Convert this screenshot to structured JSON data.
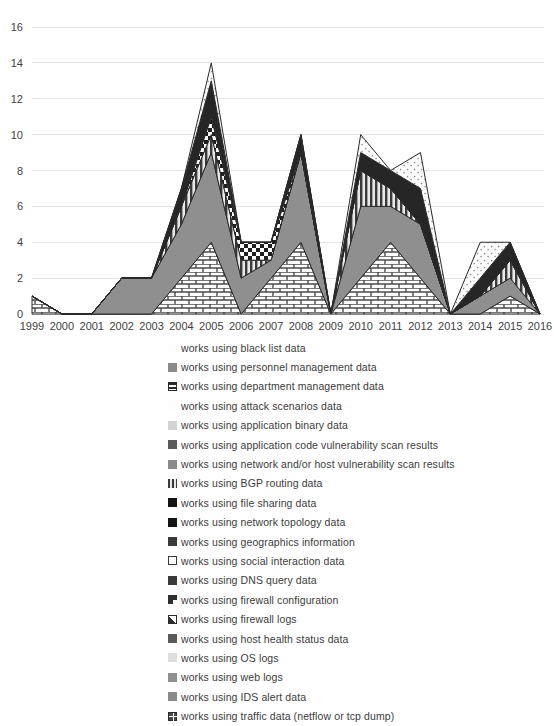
{
  "chart_data": {
    "type": "area",
    "stacked": true,
    "title": "",
    "xlabel": "",
    "ylabel": "",
    "ylim": [
      0,
      16
    ],
    "ytick_step": 2,
    "yticks": [
      "0",
      "2",
      "4",
      "6",
      "8",
      "10",
      "12",
      "14",
      "16"
    ],
    "grid": true,
    "legend_position": "bottom",
    "categories": [
      "1999",
      "2000",
      "2001",
      "2002",
      "2003",
      "2004",
      "2005",
      "2006",
      "2007",
      "2008",
      "2009",
      "2010",
      "2011",
      "2012",
      "2013",
      "2014",
      "2015",
      "2016"
    ],
    "totals": [
      1,
      0,
      0,
      2,
      2,
      7,
      14,
      4,
      4,
      10,
      0,
      10,
      8,
      9,
      0,
      4,
      4,
      0
    ],
    "series": [
      {
        "name": "works using black list data",
        "marker": "dotted-light",
        "color": "#f2f2f2",
        "values": [
          0,
          0,
          0,
          0,
          0,
          0,
          0,
          0,
          0,
          0,
          0,
          0,
          0,
          0,
          0,
          0,
          0,
          0
        ]
      },
      {
        "name": "works using personnel management data",
        "marker": "solid-midgray",
        "color": "#808080",
        "values": [
          0,
          0,
          0,
          0,
          0,
          0,
          0,
          0,
          0,
          0,
          0,
          0,
          0,
          0,
          0,
          0,
          0,
          0
        ]
      },
      {
        "name": "works using department management data",
        "marker": "horiz-bands",
        "color": "#595959",
        "values": [
          0,
          0,
          0,
          0,
          0,
          0,
          0,
          0,
          0,
          0,
          0,
          0,
          0,
          0,
          0,
          0,
          0,
          0
        ]
      },
      {
        "name": "works using attack scenarios data",
        "marker": "dotted-light",
        "color": "#fafafa",
        "values": [
          0,
          0,
          0,
          0,
          0,
          0,
          0,
          0,
          0,
          0,
          0,
          0,
          0,
          0,
          0,
          0,
          0,
          0
        ]
      },
      {
        "name": "works using application binary data",
        "marker": "solid-lightgray",
        "color": "#d0d0d0",
        "values": [
          0,
          0,
          0,
          0,
          0,
          0,
          0,
          0,
          0,
          0,
          0,
          0,
          0,
          0,
          0,
          0,
          0,
          0
        ]
      },
      {
        "name": "works using application code vulnerability scan results",
        "marker": "solid-darkgray",
        "color": "#5a5a5a",
        "values": [
          0,
          0,
          0,
          0,
          0,
          0,
          0,
          0,
          0,
          0,
          0,
          0,
          0,
          0,
          0,
          0,
          0,
          0
        ]
      },
      {
        "name": "works using network and/or host vulnerability scan results",
        "marker": "solid-gray",
        "color": "#9a9a9a",
        "values": [
          0,
          0,
          0,
          0,
          0,
          0,
          0,
          0,
          0,
          0,
          0,
          0,
          0,
          0,
          0,
          0,
          0,
          0
        ]
      },
      {
        "name": "works using BGP routing data",
        "marker": "vert-stripes",
        "color": "#6b6b6b",
        "values": [
          0,
          0,
          0,
          0,
          0,
          0,
          0,
          0,
          0,
          0,
          0,
          0,
          0,
          0,
          0,
          0,
          0,
          0
        ]
      },
      {
        "name": "works using file sharing data",
        "marker": "solid-black",
        "color": "#1a1a1a",
        "values": [
          0,
          0,
          0,
          0,
          0,
          0,
          0,
          0,
          0,
          0,
          0,
          0,
          0,
          0,
          0,
          0,
          0,
          0
        ]
      },
      {
        "name": "works using network topology data",
        "marker": "solid-black",
        "color": "#262626",
        "values": [
          0,
          0,
          0,
          0,
          0,
          0,
          0,
          0,
          0,
          0,
          0,
          0,
          0,
          0,
          0,
          0,
          0,
          0
        ]
      },
      {
        "name": "works using geographics information",
        "marker": "solid-dark",
        "color": "#3f3f3f",
        "values": [
          0,
          0,
          0,
          0,
          0,
          0,
          0,
          0,
          0,
          0,
          0,
          0,
          0,
          0,
          0,
          0,
          0,
          0
        ]
      },
      {
        "name": "works using social interaction data",
        "marker": "outline-white",
        "color": "#ffffff",
        "values": [
          0,
          0,
          0,
          0,
          0,
          0,
          0,
          0,
          0,
          0,
          0,
          0,
          0,
          1,
          0,
          1,
          0,
          0
        ]
      },
      {
        "name": "works using DNS query data",
        "marker": "solid-dark",
        "color": "#4a4a4a",
        "values": [
          0,
          0,
          0,
          0,
          0,
          0,
          0,
          0,
          0,
          0,
          0,
          0,
          0,
          0,
          0,
          0,
          0,
          0
        ]
      },
      {
        "name": "works using firewall configuration",
        "marker": "diag-corner",
        "color": "#333333",
        "values": [
          0,
          0,
          0,
          0,
          0,
          0,
          0,
          0,
          0,
          0,
          0,
          0,
          0,
          1,
          0,
          0,
          0,
          0
        ]
      },
      {
        "name": "works using firewall logs",
        "marker": "diag-white",
        "color": "#ffffff",
        "values": [
          0,
          0,
          0,
          0,
          0,
          0,
          0,
          0,
          0,
          0,
          0,
          0,
          0,
          1,
          0,
          0,
          0,
          0
        ]
      },
      {
        "name": "works using host health status data",
        "marker": "solid-darkgray",
        "color": "#404040",
        "values": [
          0,
          0,
          0,
          0,
          0,
          0,
          0,
          0,
          0,
          0,
          0,
          0,
          0,
          0,
          0,
          0,
          0,
          0
        ]
      },
      {
        "name": "works using OS logs",
        "marker": "solid-palegray",
        "color": "#dcdcdc",
        "values": [
          0,
          0,
          0,
          0,
          0,
          0,
          0,
          0,
          0,
          0,
          0,
          0,
          0,
          0,
          0,
          0,
          0,
          0
        ]
      },
      {
        "name": "works using web logs",
        "marker": "solid-midgray",
        "color": "#8c8c8c",
        "values": [
          0,
          0,
          0,
          0,
          0,
          0,
          0,
          0,
          0,
          0,
          0,
          0,
          0,
          0,
          0,
          0,
          0,
          0
        ]
      },
      {
        "name": "works using IDS alert data",
        "marker": "solid-gray",
        "color": "#888888",
        "values": [
          0,
          0,
          0,
          0,
          0,
          0,
          0,
          0,
          0,
          0,
          0,
          0,
          0,
          0,
          0,
          0,
          0,
          0
        ]
      },
      {
        "name": "works using traffic data (netflow or tcp dump)",
        "marker": "grid-square",
        "color": "#4d4d4d",
        "values": [
          0,
          0,
          0,
          0,
          0,
          0,
          0,
          0,
          0,
          0,
          0,
          0,
          0,
          0,
          0,
          0,
          0,
          0
        ]
      }
    ],
    "stack_layers": [
      {
        "id": "brick",
        "label": "works using traffic data (netflow or tcp dump)",
        "values": [
          1,
          0,
          0,
          0,
          0,
          2,
          4,
          0,
          2,
          4,
          0,
          2,
          4,
          2,
          0,
          0,
          1,
          0
        ]
      },
      {
        "id": "midgray",
        "label": "works using network and/or host vulnerability scan results",
        "values": [
          0,
          0,
          0,
          2,
          2,
          3,
          5,
          2,
          1,
          5,
          0,
          4,
          2,
          3,
          0,
          1,
          1,
          0
        ]
      },
      {
        "id": "vstripe",
        "label": "works using BGP routing data",
        "values": [
          0,
          0,
          0,
          0,
          0,
          1,
          1,
          1,
          0,
          0,
          0,
          2,
          1,
          0,
          0,
          0,
          1,
          0
        ]
      },
      {
        "id": "checker",
        "label": "works using firewall configuration",
        "values": [
          0,
          0,
          0,
          0,
          0,
          0,
          1,
          1,
          1,
          0,
          0,
          0,
          0,
          0,
          0,
          0,
          0,
          0
        ]
      },
      {
        "id": "dark",
        "label": "works using file sharing data",
        "values": [
          0,
          0,
          0,
          0,
          0,
          1,
          2,
          0,
          0,
          1,
          0,
          1,
          1,
          2,
          0,
          1,
          1,
          0
        ]
      },
      {
        "id": "lightdot",
        "label": "works using social interaction data",
        "values": [
          0,
          0,
          0,
          0,
          0,
          0,
          1,
          0,
          0,
          0,
          0,
          1,
          0,
          2,
          0,
          2,
          0,
          0
        ]
      }
    ]
  },
  "legend": {
    "items": [
      {
        "label": "works using black list data",
        "marker": "dotted-faint"
      },
      {
        "label": "works using personnel management data",
        "marker": "solid-gray"
      },
      {
        "label": "works using department management data",
        "marker": "horiz-bands"
      },
      {
        "label": "works using attack scenarios data",
        "marker": "dotted-faint"
      },
      {
        "label": "works using application binary data",
        "marker": "solid-lightgray"
      },
      {
        "label": "works using application code vulnerability scan results",
        "marker": "solid-darkgray"
      },
      {
        "label": "works using network and/or host vulnerability scan results",
        "marker": "solid-gray"
      },
      {
        "label": "works using BGP routing data",
        "marker": "vert-stripes"
      },
      {
        "label": "works using file sharing data",
        "marker": "solid-black"
      },
      {
        "label": "works using network topology data",
        "marker": "solid-black"
      },
      {
        "label": "works using geographics information",
        "marker": "solid-dark"
      },
      {
        "label": "works using social interaction data",
        "marker": "outline-white"
      },
      {
        "label": "works using DNS query data",
        "marker": "solid-dark"
      },
      {
        "label": "works using firewall configuration",
        "marker": "diag-corner"
      },
      {
        "label": "works using firewall logs",
        "marker": "diag-white"
      },
      {
        "label": "works using host health status data",
        "marker": "solid-darkgray"
      },
      {
        "label": "works using OS logs",
        "marker": "solid-palegray"
      },
      {
        "label": "works using web logs",
        "marker": "solid-midgray"
      },
      {
        "label": "works using IDS alert data",
        "marker": "solid-gray"
      },
      {
        "label": "works using traffic data (netflow or tcp dump)",
        "marker": "grid-square"
      }
    ]
  },
  "colors": {
    "grid": "#e4e4e4",
    "text": "#3f3f3f",
    "brick": "#f5f5f5",
    "midgray": "#8f8f8f",
    "dark": "#262626",
    "vstripe": "#6b6b6b",
    "checker": "#2b2b2b",
    "lightdot": "#fbfbfb"
  }
}
